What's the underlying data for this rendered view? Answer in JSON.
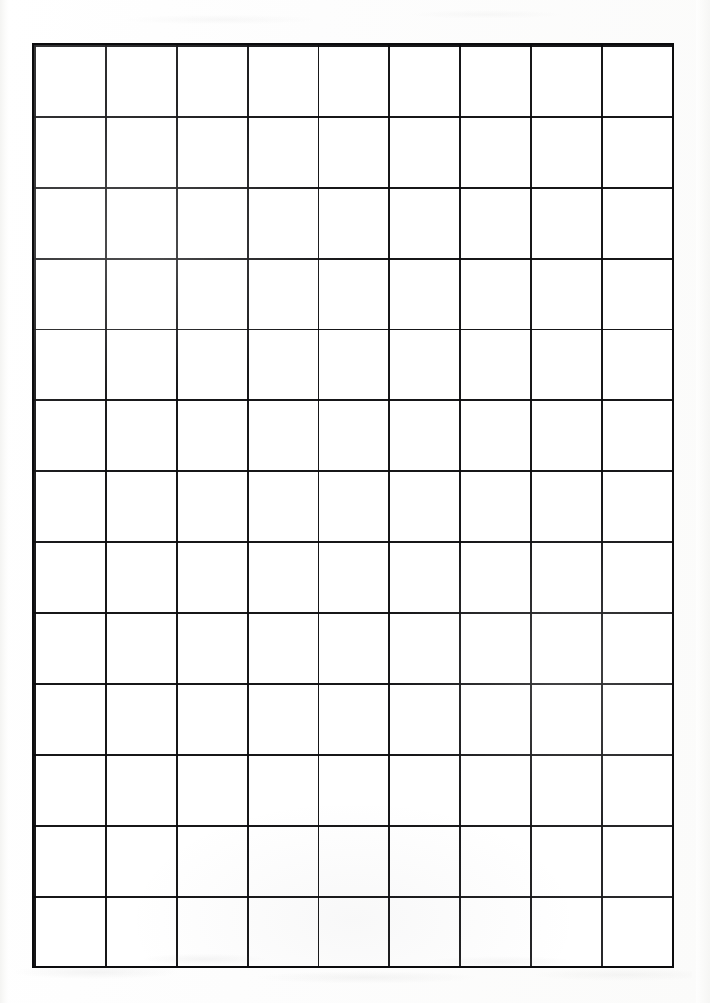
{
  "document": {
    "kind": "graph-paper-scan",
    "title": "Graph paper sheet",
    "page_width": 710,
    "page_height": 1003,
    "background_color": "#fdfdfc",
    "paper_color": "#ffffff"
  },
  "grid": {
    "label": "millimeter-style graph grid",
    "left": 34,
    "top": 45,
    "width": 638,
    "height": 921,
    "minor_spacing_px": 7.089,
    "medium_every": 5,
    "major_every": 10,
    "minor_spacing_css": "7.089px",
    "medium_spacing_css": "35.444px",
    "major_spacing_css": "70.889px",
    "columns_minor": 90,
    "rows_minor": 130,
    "columns_major": 9,
    "rows_major": 13,
    "minor_color": "#282a2d",
    "medium_color": "#19191e",
    "major_color": "#0a0a0c",
    "border_color": "#0b0b0d",
    "border_width_px": 2.2
  },
  "margins": {
    "left_px": 34,
    "right_px": 38,
    "top_px": 45,
    "bottom_px": 37,
    "artifact_note": "faint scanner smudges along the lower margin"
  }
}
